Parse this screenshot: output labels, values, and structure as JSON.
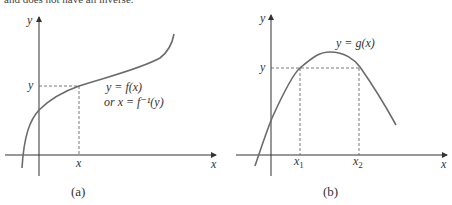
{
  "top_text": "and does not have an inverse.",
  "panels": [
    {
      "caption": "(a)",
      "axis_x": "x",
      "axis_y": "y",
      "tick_x": "x",
      "tick_y": "y",
      "curve_label_1": "y = f(x)",
      "curve_label_2": "or x = f⁻¹(y)"
    },
    {
      "caption": "(b)",
      "axis_x": "x",
      "axis_y": "y",
      "tick_x1": "x",
      "tick_x1_sub": "1",
      "tick_x2": "x",
      "tick_x2_sub": "2",
      "tick_y": "y",
      "curve_label": "y = g(x)"
    }
  ],
  "colors": {
    "curve": "#6b6b6b",
    "axis": "#333333",
    "dash": "#555555"
  }
}
